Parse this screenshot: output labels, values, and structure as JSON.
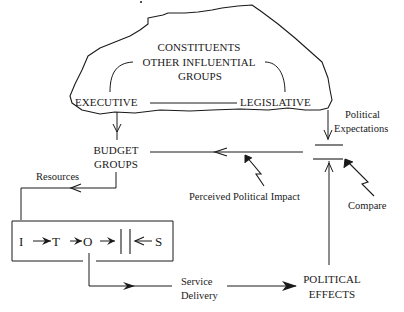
{
  "diagram": {
    "type": "feedback-loop",
    "cloud": {
      "labels": {
        "constituents": "CONSTITUENTS",
        "other_influential_1": "OTHER  INFLUENTIAL",
        "other_influential_2": "GROUPS",
        "executive": "EXECUTIVE",
        "legislative": "LEGISLATIVE"
      }
    },
    "nodes": {
      "budget_groups_1": "BUDGET",
      "budget_groups_2": "GROUPS",
      "political_expectations_1": "Political",
      "political_expectations_2": "Expectations",
      "perceived_political_impact": "Perceived  Political  Impact",
      "compare": "Compare",
      "resources": "Resources",
      "service_delivery_1": "Service",
      "service_delivery_2": "Delivery",
      "political_effects_1": "POLITICAL",
      "political_effects_2": "EFFECTS"
    },
    "process_box": {
      "i": "I",
      "t": "T",
      "o": "O",
      "s": "S"
    },
    "edges": [
      {
        "from": "EXECUTIVE",
        "to": "BUDGET GROUPS"
      },
      {
        "from": "LEGISLATIVE",
        "to": "Compare",
        "label": "Political Expectations"
      },
      {
        "from": "Compare",
        "to": "BUDGET GROUPS",
        "label": "Perceived Political Impact"
      },
      {
        "from": "BUDGET GROUPS",
        "to": "I-T-O-S box",
        "label": "Resources"
      },
      {
        "from": "O",
        "to": "POLITICAL EFFECTS",
        "label": "Service Delivery"
      },
      {
        "from": "POLITICAL EFFECTS",
        "to": "Compare"
      }
    ],
    "colors": {
      "ink": "#1a1a1a",
      "background": "#ffffff"
    }
  }
}
